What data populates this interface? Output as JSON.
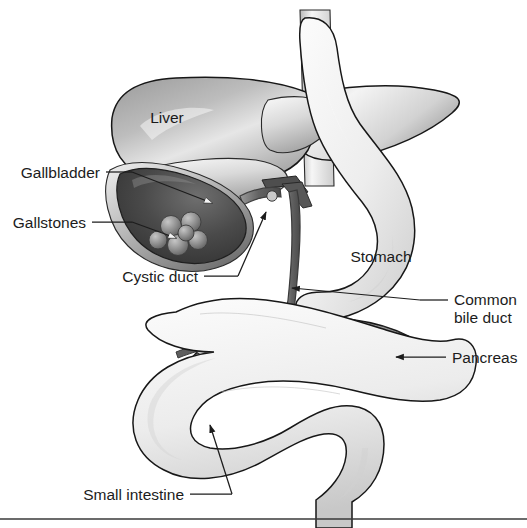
{
  "figure": {
    "background_color": "#ffffff",
    "width": 527,
    "height": 528,
    "style": "grayscale medical illustration"
  },
  "labels": {
    "liver": "Liver",
    "gallbladder": "Gallbladder",
    "gallstones": "Gallstones",
    "cystic_duct": "Cystic duct",
    "stomach": "Stomach",
    "common_bile_duct_line1": "Common",
    "common_bile_duct_line2": "bile duct",
    "pancreas": "Pancreas",
    "small_intestine": "Small intestine"
  },
  "colors": {
    "text": "#1c1c1c",
    "outline": "#171717",
    "liver_dark": "#8d8d8d",
    "liver_light": "#efefef",
    "gallbladder_dark": "#3d3d3d",
    "gallbladder_rim": "#c9c9c9",
    "gallstone": "#8a8a8a",
    "stomach_light": "#f2f2f2",
    "stomach_shade": "#d8d8d8",
    "pancreas": "#8f8f8f",
    "duct": "#6e6e6e",
    "intestine": "#ededed",
    "rule": "#3a3a3a"
  },
  "parts": [
    {
      "name": "liver",
      "label": "Liver",
      "label_position": "inside-upper-left"
    },
    {
      "name": "gallbladder",
      "label": "Gallbladder",
      "label_position": "left",
      "leader": "arrow"
    },
    {
      "name": "gallstones",
      "label": "Gallstones",
      "label_position": "left",
      "leader": "arrow",
      "count": 6
    },
    {
      "name": "cystic-duct",
      "label": "Cystic duct",
      "label_position": "bottom-left",
      "leader": "arrow"
    },
    {
      "name": "stomach",
      "label": "Stomach",
      "label_position": "inside"
    },
    {
      "name": "common-bile-duct",
      "label": "Common bile duct",
      "label_position": "right",
      "leader": "arrow"
    },
    {
      "name": "pancreas",
      "label": "Pancreas",
      "label_position": "right",
      "leader": "arrow"
    },
    {
      "name": "small-intestine",
      "label": "Small intestine",
      "label_position": "bottom",
      "leader": "arrow"
    }
  ],
  "footer": {
    "has_horizontal_rule": true
  }
}
